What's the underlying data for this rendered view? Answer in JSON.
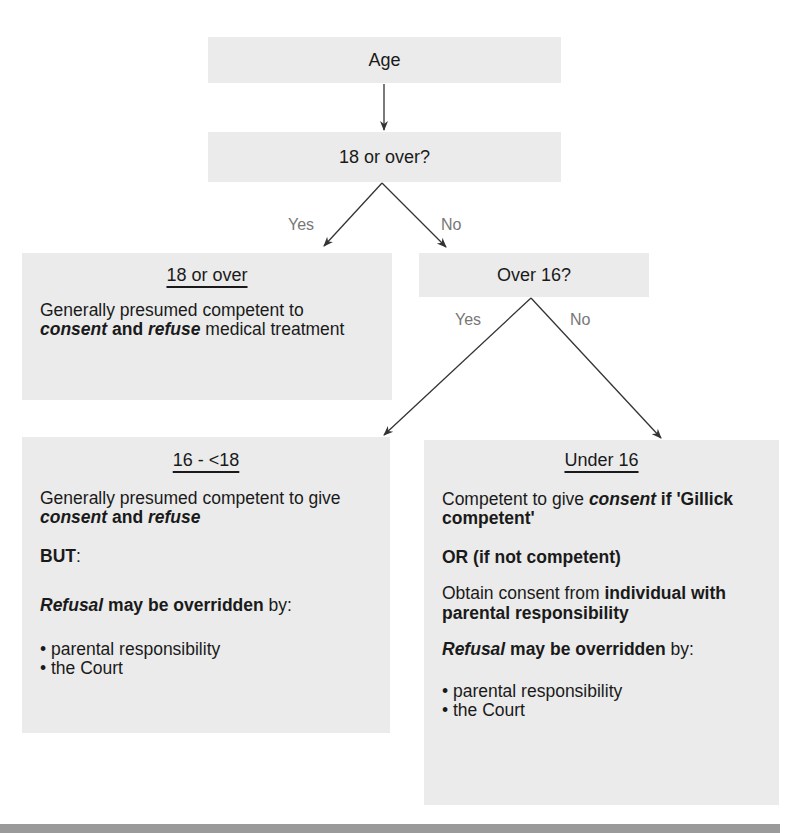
{
  "diagram": {
    "type": "decision-flowchart",
    "colors": {
      "box_fill": "#ebebeb",
      "text": "#1a1a1a",
      "edge_label": "#777777",
      "arrow": "#333333",
      "footer_bar": "#9a9a9a"
    },
    "nodes": {
      "age": {
        "label": "Age"
      },
      "q18": {
        "label": "18 or over?"
      },
      "q16": {
        "label": "Over 16?"
      },
      "adult": {
        "heading": "18 or over",
        "p1": {
          "t1": "Generally presumed competent to ",
          "t2": "consent",
          "t3": " and ",
          "t4": "refuse",
          "t5": " medical treatment"
        }
      },
      "sixteen_to_eighteen": {
        "heading": "16 - <18",
        "p1": {
          "t1": "Generally presumed competent to give ",
          "t2": "consent",
          "t3": " and ",
          "t4": "refuse"
        },
        "p2": {
          "t1": "BUT",
          "t2": ":"
        },
        "p3": {
          "t1": "Refusal",
          "t2": " may be overridden",
          "t3": " by:"
        },
        "bullets": [
          "parental responsibility",
          "the Court"
        ]
      },
      "under16": {
        "heading": "Under 16",
        "p1": {
          "t1": "Competent to give ",
          "t2": "consent",
          "t3": " if 'Gillick competent'"
        },
        "p2": {
          "t1": "OR (if not competent)"
        },
        "p3": {
          "t1": "Obtain consent from ",
          "t2": "individual with parental responsibility"
        },
        "p4": {
          "t1": "Refusal",
          "t2": " may be overridden",
          "t3": " by:"
        },
        "bullets": [
          "parental responsibility",
          "the Court"
        ]
      }
    },
    "edges": [
      {
        "from": "age",
        "to": "q18",
        "label": ""
      },
      {
        "from": "q18",
        "to": "adult",
        "label": "Yes"
      },
      {
        "from": "q18",
        "to": "q16",
        "label": "No"
      },
      {
        "from": "q16",
        "to": "sixteen_to_eighteen",
        "label": "Yes"
      },
      {
        "from": "q16",
        "to": "under16",
        "label": "No"
      }
    ]
  }
}
